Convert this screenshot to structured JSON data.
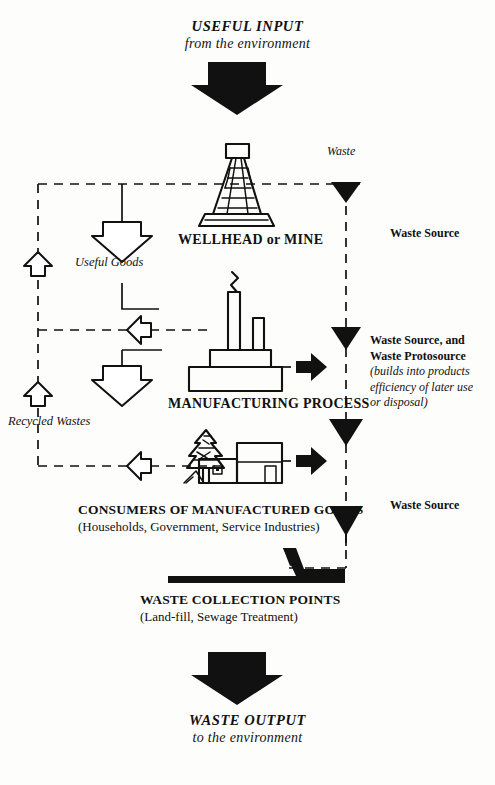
{
  "diagram": {
    "title_top": {
      "line1": "USEFUL INPUT",
      "line2": "from the environment"
    },
    "title_bottom": {
      "line1": "WASTE OUTPUT",
      "line2": "to the environment"
    },
    "stages": [
      {
        "id": "wellhead",
        "label": "WELLHEAD or MINE",
        "icon": "oil-derrick-icon"
      },
      {
        "id": "manufacturing",
        "label": "MANUFACTURING PROCESS",
        "icon": "factory-icon"
      },
      {
        "id": "consumers",
        "label": "CONSUMERS OF MANUFACTURED GOODS",
        "sublabel": "(Households, Government, Service Industries)",
        "icon": "houses-and-tree-icon"
      },
      {
        "id": "collection",
        "label": "WASTE COLLECTION POINTS",
        "sublabel": "(Land-fill, Sewage Treatment)",
        "icon": "waste-pile-icon"
      }
    ],
    "flow_labels": {
      "waste": "Waste",
      "useful_goods": "Useful Goods",
      "recycled_wastes": "Recycled Wastes"
    },
    "annotations": {
      "waste_source_1": "Waste Source",
      "waste_source_3": "Waste Source",
      "protosource_line1": "Waste Source, and",
      "protosource_line2": "Waste Protosource",
      "protosource_note1": "(builds into products",
      "protosource_note2": "efficiency of later use",
      "protosource_note3": "or disposal)"
    },
    "colors": {
      "ink": "#111111",
      "paper": "#fdfdfb",
      "arrow_fill": "#111111",
      "hollow_arrow_fill": "#ffffff"
    }
  }
}
